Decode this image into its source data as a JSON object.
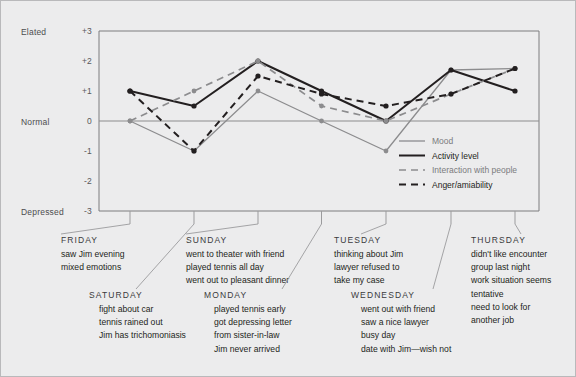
{
  "figure": {
    "background_color": "#ececed",
    "frame_color": "#7c7c7e",
    "axis_left_labels": [
      "Elated",
      "Normal",
      "Depressed"
    ],
    "ylabel_top": "Elated",
    "ylabel_mid": "Normal",
    "ylabel_bottom": "Depressed"
  },
  "legend": {
    "position": "inside-right-middle",
    "items": [
      {
        "label": "Mood",
        "style": "solid",
        "color": "#8c8c8e",
        "width": 1.3
      },
      {
        "label": "Activity level",
        "style": "solid",
        "color": "#231f20",
        "width": 2.0
      },
      {
        "label": "Interaction with people",
        "style": "dashed",
        "color": "#8c8c8e",
        "width": 1.7
      },
      {
        "label": "Anger/amiability",
        "style": "dashed",
        "color": "#231f20",
        "width": 2.0
      }
    ]
  },
  "chart_data": {
    "type": "line",
    "title": "",
    "xlabel": "",
    "ylabel": "",
    "ylim": [
      -3,
      3
    ],
    "ytick_labels": [
      "+3",
      "+2",
      "+1",
      "0",
      "-1",
      "-2",
      "-3"
    ],
    "ytick_values": [
      3,
      2,
      1,
      0,
      -1,
      -2,
      -3
    ],
    "grid": false,
    "zero_line": true,
    "categories": [
      "FRIDAY",
      "SATURDAY",
      "SUNDAY",
      "MONDAY",
      "TUESDAY",
      "WEDNESDAY",
      "THURSDAY"
    ],
    "series": [
      {
        "name": "Mood",
        "color": "#8c8c8e",
        "style": "solid",
        "values": [
          0,
          -1,
          1,
          0,
          -1,
          1.7,
          1.75
        ]
      },
      {
        "name": "Activity level",
        "color": "#231f20",
        "style": "solid",
        "values": [
          1,
          0.5,
          2,
          1,
          0,
          1.7,
          1
        ]
      },
      {
        "name": "Interaction with people",
        "color": "#8c8c8e",
        "style": "dashed",
        "values": [
          0,
          1,
          2,
          0.5,
          0,
          0.9,
          1.75
        ]
      },
      {
        "name": "Anger/amiability",
        "color": "#231f20",
        "style": "dashed",
        "values": [
          1,
          -1,
          1.5,
          0.9,
          0.5,
          0.9,
          1.75
        ]
      }
    ]
  },
  "annotations": [
    {
      "day": "FRIDAY",
      "lines": [
        "saw Jim evening",
        "mixed emotions"
      ]
    },
    {
      "day": "SATURDAY",
      "lines": [
        "fight about car",
        "tennis rained out",
        "Jim has trichomoniasis"
      ]
    },
    {
      "day": "SUNDAY",
      "lines": [
        "went to theater with friend",
        "played tennis all day",
        "went out to pleasant dinner"
      ]
    },
    {
      "day": "MONDAY",
      "lines": [
        "played tennis early",
        "got depressing letter",
        "from sister-in-law",
        "Jim never arrived"
      ]
    },
    {
      "day": "TUESDAY",
      "lines": [
        "thinking about Jim",
        "lawyer refused to",
        "take my case"
      ]
    },
    {
      "day": "WEDNESDAY",
      "lines": [
        "went out with friend",
        "saw a nice lawyer",
        "busy day",
        "date with Jim—wish not"
      ]
    },
    {
      "day": "THURSDAY",
      "lines": [
        "didn't like encounter",
        "group last night",
        "work situation seems",
        "tentative",
        "need to look for",
        "another job"
      ]
    }
  ]
}
